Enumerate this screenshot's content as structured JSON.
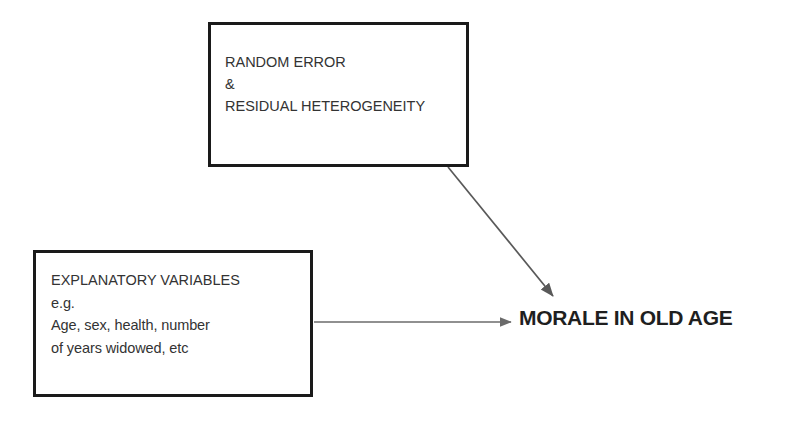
{
  "diagram": {
    "background_color": "#ffffff",
    "line_color": "#595959",
    "box_border_color": "#1a1a1a",
    "text_color": "#333333",
    "nodes": {
      "random_error": {
        "lines": [
          "RANDOM ERROR",
          "&",
          "RESIDUAL HETEROGENEITY"
        ]
      },
      "explanatory_variables": {
        "lines": [
          "EXPLANATORY VARIABLES",
          "e.g.",
          "Age, sex, health, number",
          "of years widowed, etc"
        ]
      },
      "outcome": {
        "label": "MORALE IN OLD AGE"
      }
    },
    "arrows": [
      {
        "name": "random-error-to-outcome",
        "from": "random_error",
        "to": "outcome",
        "style": "diagonal"
      },
      {
        "name": "explanatory-to-outcome",
        "from": "explanatory_variables",
        "to": "outcome",
        "style": "horizontal"
      }
    ]
  }
}
